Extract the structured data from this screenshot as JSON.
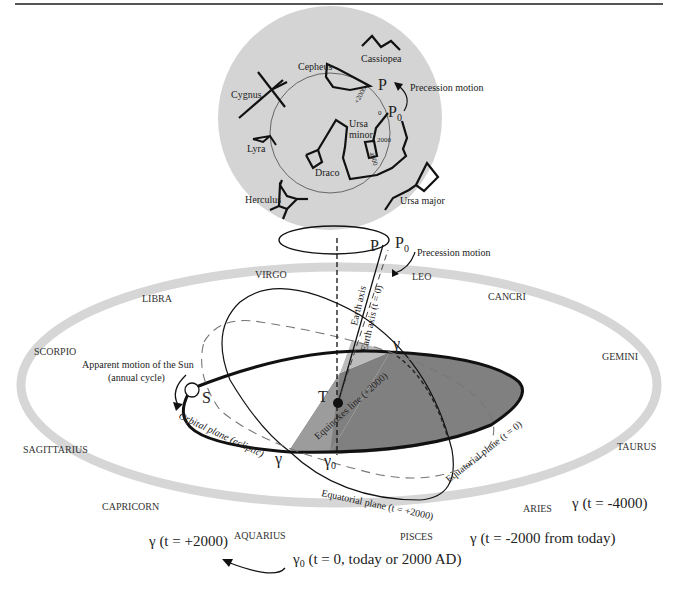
{
  "figure": {
    "celestial_sphere": {
      "constellations": [
        {
          "name": "Cassiopea"
        },
        {
          "name": "Cepheus"
        },
        {
          "name": "Cygnus"
        },
        {
          "name": "Lyra"
        },
        {
          "name": "Draco"
        },
        {
          "name": "Ursa minor",
          "line1": "Ursa",
          "line2": "minor"
        },
        {
          "name": "Herculus"
        },
        {
          "name": "Ursa major"
        }
      ],
      "pole_labels": {
        "P": "P",
        "P0": "P",
        "P0_sub": "0"
      },
      "precession_label": "Precession motion",
      "circle_ticks": [
        "+2000",
        "0",
        "2000",
        "4000"
      ]
    },
    "axis_area": {
      "P": "P",
      "P0": "P",
      "P0_sub": "0",
      "precession_label": "Precession motion",
      "earth_axis": "Earth axis",
      "earth_axis_t0": "Earth axis (t = 0)"
    },
    "zodiac": [
      "VIRGO",
      "LEO",
      "LIBRA",
      "CANCRI",
      "SCORPIO",
      "GEMINI",
      "SAGITTARIUS",
      "TAURUS",
      "CAPRICORN",
      "ARIES",
      "AQUARIUS",
      "PISCES"
    ],
    "sun": {
      "label": "S",
      "motion_line1": "Apparent motion of the Sun",
      "motion_line2": "(annual cycle)"
    },
    "earth": {
      "label": "T"
    },
    "planes": {
      "orbital": "Orbital plane (ecliptic)",
      "equatorial_2000": "Equatorial plane (t = +2000)",
      "equatorial_0": "Equatorial plane (t = 0)",
      "equinoxes_line": "Equinoxes line (+2000)"
    },
    "gamma_points": {
      "gamma": "γ",
      "gamma0": "γ",
      "gamma0_sub": "0"
    },
    "epochs": {
      "t_plus_2000": "γ (t = +2000)",
      "t_minus_4000": "γ (t = -4000)",
      "t_minus_2000": "γ (t = -2000 from today)",
      "t_0_prefix": "γ",
      "t_0_sub": "0",
      "t_0_text": " (t = 0, today or 2000 AD)"
    },
    "colors": {
      "sphere_fill": "#d4d4d4",
      "zodiac_band": "#d6d6d6",
      "ecliptic_dark": "#808080",
      "ecliptic_light": "#bdbdbd",
      "line": "#111111"
    }
  }
}
